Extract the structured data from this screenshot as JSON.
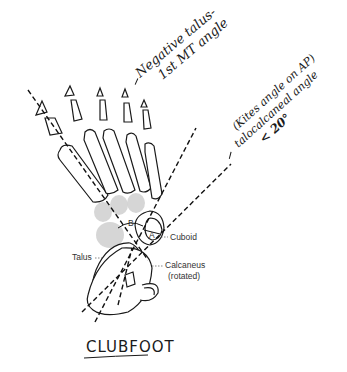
{
  "annotations": {
    "negative_talus": {
      "line1": "Negative talus-",
      "line2": "1st MT angle"
    },
    "kites_angle": {
      "line1": "(Kites angle on AP)",
      "line2": "talocalcaneal angle",
      "line3": "< 20°"
    }
  },
  "labels": {
    "talus": "Talus",
    "cuboid": "Cuboid",
    "calcaneus": "Calcaneus",
    "calcaneus_note": "(rotated)",
    "marker_b": "B",
    "marker_a": "A"
  },
  "title": "CLUBFOOT",
  "colors": {
    "ink": "#1a1a1a",
    "shadow": "#cfcfcf",
    "background": "#ffffff"
  }
}
